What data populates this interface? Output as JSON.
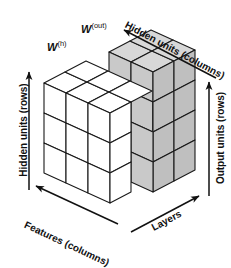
{
  "figure": {
    "type": "isometric-block-diagram",
    "title_visible": false,
    "background_color": "#ffffff",
    "line_color": "#1a1a1a",
    "white_block_fill": "#ffffff",
    "gray_block_fill": "#c9c9c9",
    "gray_block_top_fill": "#d6d6d6",
    "gray_block_side_fill": "#bdbdbd"
  },
  "tensors": {
    "hidden_weight": {
      "symbol": "W",
      "superscript": "(h)",
      "label": "W (h)",
      "fill": "white",
      "rows": 3,
      "columns": 3,
      "layers": 2
    },
    "output_weight": {
      "symbol": "W",
      "superscript": "(out)",
      "label": "W (out)",
      "fill": "gray",
      "rows": 3,
      "columns": 2,
      "layers": 2
    }
  },
  "axes": [
    {
      "name": "hidden-units-rows",
      "label": "Hidden units (rows)",
      "position": "left",
      "orientation": "vertical",
      "arrow_direction": "up"
    },
    {
      "name": "features-columns",
      "label": "Features (columns)",
      "position": "bottom-left",
      "orientation": "diagonal",
      "arrow_direction": "up-left"
    },
    {
      "name": "layers",
      "label": "Layers",
      "position": "bottom-right",
      "orientation": "diagonal",
      "arrow_direction": "up-right"
    },
    {
      "name": "hidden-units-columns",
      "label": "Hidden units (columns)",
      "position": "top-right",
      "orientation": "diagonal",
      "arrow_direction": "up-left"
    },
    {
      "name": "output-units-rows",
      "label": "Output units (rows)",
      "position": "right",
      "orientation": "vertical",
      "arrow_direction": "up"
    }
  ]
}
